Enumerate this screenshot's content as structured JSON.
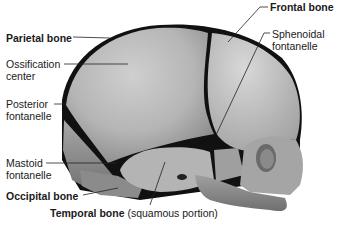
{
  "diagram": {
    "labels": {
      "parietal_bone": "Parietal bone",
      "ossification_center_1": "Ossification",
      "ossification_center_2": "center",
      "posterior_fontanelle_1": "Posterior",
      "posterior_fontanelle_2": "fontanelle",
      "mastoid_fontanelle_1": "Mastoid",
      "mastoid_fontanelle_2": "fontanelle",
      "occipital_bone": "Occipital bone",
      "temporal_bone": "Temporal bone",
      "temporal_bone_note": "(squamous portion)",
      "frontal_bone": "Frontal bone",
      "sphenoidal_fontanelle_1": "Sphenoidal",
      "sphenoidal_fontanelle_2": "fontanelle"
    },
    "colors": {
      "bone_light": "#c9c9c9",
      "bone_mid": "#a9a9a9",
      "bone_dark": "#7a7a7a",
      "suture": "#111111",
      "text": "#1a1a1a"
    }
  }
}
